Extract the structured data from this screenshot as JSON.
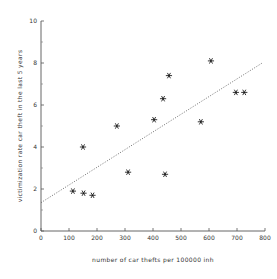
{
  "chart_data": {
    "type": "scatter",
    "title": "",
    "xlabel": "number of car thefts per 100000 inh",
    "ylabel": "victimization rate car theft in the last 5 years",
    "xlim": [
      0,
      800
    ],
    "ylim": [
      0,
      10
    ],
    "xticks": [
      0,
      100,
      200,
      300,
      400,
      500,
      600,
      700,
      800
    ],
    "xtick_labels": [
      "0",
      "100",
      "200",
      "300",
      "400",
      "500",
      "600",
      "700",
      "800"
    ],
    "yticks": [
      0,
      2,
      4,
      6,
      8,
      10
    ],
    "ytick_labels": [
      "0",
      "2",
      "4",
      "6",
      "8",
      "10"
    ],
    "yticks_minor": [
      1,
      3,
      5,
      7,
      9
    ],
    "grid": false,
    "legend": null,
    "marker": "asterisk",
    "points": [
      {
        "x": 114,
        "y": 1.9
      },
      {
        "x": 150,
        "y": 4.0
      },
      {
        "x": 152,
        "y": 1.8
      },
      {
        "x": 184,
        "y": 1.7
      },
      {
        "x": 271,
        "y": 5.0
      },
      {
        "x": 311,
        "y": 2.8
      },
      {
        "x": 404,
        "y": 5.3
      },
      {
        "x": 436,
        "y": 6.3
      },
      {
        "x": 443,
        "y": 2.7
      },
      {
        "x": 457,
        "y": 7.4
      },
      {
        "x": 571,
        "y": 5.2
      },
      {
        "x": 607,
        "y": 8.1
      },
      {
        "x": 696,
        "y": 6.6
      },
      {
        "x": 726,
        "y": 6.6
      }
    ],
    "trendline": {
      "style": "dotted",
      "x_start": 0,
      "y_start": 1.35,
      "x_end": 790,
      "y_end": 8.0
    }
  },
  "colors": {
    "background": "#ffffff",
    "axis": "#555555",
    "marker": "#111111",
    "trendline": "#555555",
    "text": "#333333"
  }
}
